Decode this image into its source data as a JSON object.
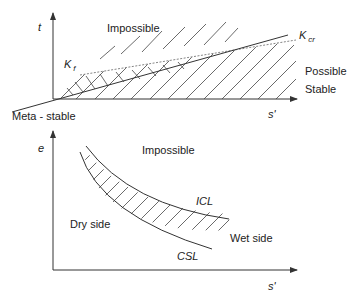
{
  "top_panel": {
    "y_axis_label": "t",
    "x_axis_label": "s'",
    "regions": {
      "upper": "Impossible",
      "right_1": "Possible",
      "right_2": "Stable",
      "left": "Meta - stable"
    },
    "lines": {
      "kf": {
        "main": "K",
        "sub": "f"
      },
      "kcr": {
        "main": "K",
        "sub": "cr"
      }
    }
  },
  "bottom_panel": {
    "y_axis_label": "e",
    "x_axis_label": "s'",
    "regions": {
      "upper": "Impossible",
      "left": "Dry side",
      "right": "Wet side"
    },
    "curves": {
      "upper": "ICL",
      "lower": "CSL"
    }
  },
  "colors": {
    "line": "#333333",
    "hatch": "#444444",
    "dashed": "#777777",
    "text": "#222222"
  }
}
